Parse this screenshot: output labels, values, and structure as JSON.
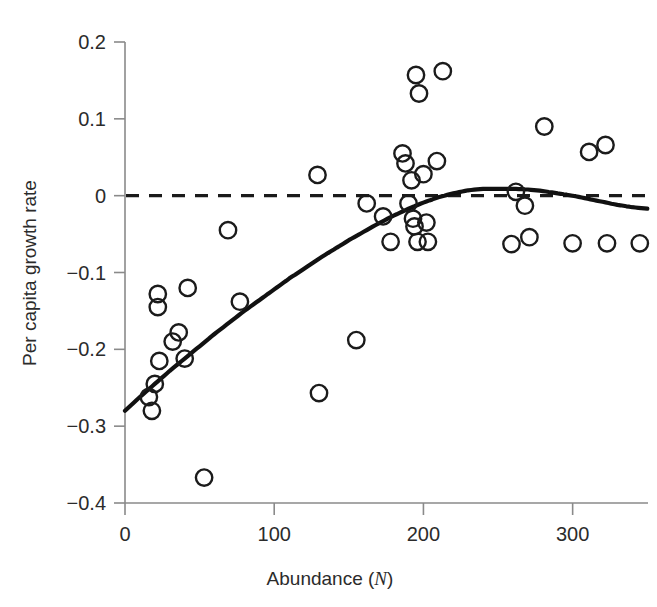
{
  "chart_data": {
    "type": "scatter",
    "title": "",
    "xlabel": "Abundance (N)",
    "xlabel_plain": "Abundance (",
    "xlabel_italic": "N",
    "xlabel_close": ")",
    "ylabel": "Per capita growth rate",
    "xlim": [
      0,
      350
    ],
    "ylim": [
      -0.4,
      0.2
    ],
    "xticks": [
      0,
      100,
      200,
      300
    ],
    "xtick_labels": [
      "0",
      "100",
      "200",
      "300"
    ],
    "yticks": [
      0.2,
      0.1,
      0,
      -0.1,
      -0.2,
      -0.3,
      -0.4
    ],
    "ytick_labels": [
      "0.2",
      "0.1",
      "0",
      "-0.1",
      "-0.2",
      "-0.3",
      "-0.4"
    ],
    "grid": false,
    "legend": false,
    "marker": "open-circle",
    "points": [
      {
        "x": 16,
        "y": -0.262
      },
      {
        "x": 18,
        "y": -0.28
      },
      {
        "x": 20,
        "y": -0.245
      },
      {
        "x": 22,
        "y": -0.128
      },
      {
        "x": 22,
        "y": -0.145
      },
      {
        "x": 23,
        "y": -0.215
      },
      {
        "x": 32,
        "y": -0.19
      },
      {
        "x": 36,
        "y": -0.178
      },
      {
        "x": 40,
        "y": -0.212
      },
      {
        "x": 42,
        "y": -0.12
      },
      {
        "x": 53,
        "y": -0.367
      },
      {
        "x": 69,
        "y": -0.045
      },
      {
        "x": 77,
        "y": -0.138
      },
      {
        "x": 129,
        "y": 0.027
      },
      {
        "x": 130,
        "y": -0.257
      },
      {
        "x": 155,
        "y": -0.188
      },
      {
        "x": 162,
        "y": -0.01
      },
      {
        "x": 173,
        "y": -0.027
      },
      {
        "x": 178,
        "y": -0.06
      },
      {
        "x": 186,
        "y": 0.055
      },
      {
        "x": 188,
        "y": 0.042
      },
      {
        "x": 190,
        "y": -0.01
      },
      {
        "x": 192,
        "y": 0.02
      },
      {
        "x": 193,
        "y": -0.03
      },
      {
        "x": 194,
        "y": -0.04
      },
      {
        "x": 195,
        "y": 0.157
      },
      {
        "x": 196,
        "y": -0.06
      },
      {
        "x": 197,
        "y": 0.133
      },
      {
        "x": 200,
        "y": 0.028
      },
      {
        "x": 202,
        "y": -0.035
      },
      {
        "x": 203,
        "y": -0.06
      },
      {
        "x": 209,
        "y": 0.045
      },
      {
        "x": 213,
        "y": 0.162
      },
      {
        "x": 259,
        "y": -0.063
      },
      {
        "x": 262,
        "y": 0.005
      },
      {
        "x": 268,
        "y": -0.013
      },
      {
        "x": 271,
        "y": -0.054
      },
      {
        "x": 281,
        "y": 0.09
      },
      {
        "x": 300,
        "y": -0.062
      },
      {
        "x": 311,
        "y": 0.057
      },
      {
        "x": 322,
        "y": 0.066
      },
      {
        "x": 323,
        "y": -0.062
      },
      {
        "x": 345,
        "y": -0.062
      }
    ],
    "fit_curve": {
      "name": "fitted-growth-curve",
      "x": [
        0,
        10,
        20,
        30,
        40,
        50,
        60,
        70,
        80,
        90,
        100,
        110,
        120,
        130,
        140,
        150,
        160,
        170,
        180,
        190,
        200,
        210,
        220,
        230,
        240,
        250,
        260,
        270,
        280,
        290,
        300,
        310,
        320,
        330,
        340,
        350
      ],
      "y": [
        -0.28,
        -0.262,
        -0.245,
        -0.228,
        -0.212,
        -0.196,
        -0.18,
        -0.165,
        -0.15,
        -0.136,
        -0.122,
        -0.108,
        -0.095,
        -0.082,
        -0.07,
        -0.058,
        -0.047,
        -0.036,
        -0.026,
        -0.017,
        -0.009,
        -0.002,
        0.003,
        0.007,
        0.009,
        0.009,
        0.009,
        0.008,
        0.006,
        0.003,
        0.0,
        -0.004,
        -0.008,
        -0.012,
        -0.015,
        -0.017
      ]
    },
    "zero_reference_line": {
      "name": "zero-growth-line",
      "y": 0,
      "style": "dashed"
    }
  }
}
